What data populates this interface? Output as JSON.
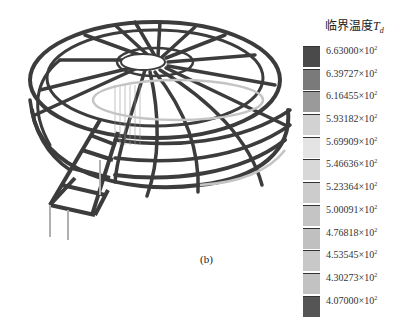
{
  "figure": {
    "caption": "(b)"
  },
  "legend": {
    "title_text": "临界温度",
    "title_var": "T",
    "title_sub": "d",
    "entries": [
      {
        "mantissa": "6.63000",
        "exp": "2",
        "color": "#4a4a4a"
      },
      {
        "mantissa": "6.39727",
        "exp": "2",
        "color": "#7a7a7a"
      },
      {
        "mantissa": "6.16455",
        "exp": "2",
        "color": "#9a9a9a"
      },
      {
        "mantissa": "5.93182",
        "exp": "2",
        "color": "#d2d2d2"
      },
      {
        "mantissa": "5.69909",
        "exp": "2",
        "color": "#e4e4e4"
      },
      {
        "mantissa": "5.46636",
        "exp": "2",
        "color": "#d8d8d8"
      },
      {
        "mantissa": "5.23364",
        "exp": "2",
        "color": "#cccccc"
      },
      {
        "mantissa": "5.00091",
        "exp": "2",
        "color": "#c4c4c4"
      },
      {
        "mantissa": "4.76818",
        "exp": "2",
        "color": "#c0c0c0"
      },
      {
        "mantissa": "4.53545",
        "exp": "2",
        "color": "#c8c8c8"
      },
      {
        "mantissa": "4.30273",
        "exp": "2",
        "color": "#c2c2c2"
      },
      {
        "mantissa": "4.07000",
        "exp": "2",
        "color": "#555555"
      }
    ]
  },
  "chart_data": {
    "type": "heatmap",
    "legend_values": [
      663.0,
      639.727,
      616.455,
      593.182,
      569.909,
      546.636,
      523.364,
      500.091,
      476.818,
      453.545,
      430.273,
      407.0
    ],
    "range": [
      407.0,
      663.0
    ],
    "caption": "(b)"
  }
}
